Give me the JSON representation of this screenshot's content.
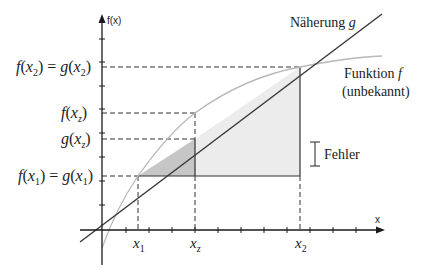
{
  "diagram": {
    "y_axis_label": "f(x)",
    "x_axis_label": "x",
    "line_label": {
      "text": "Näherung ",
      "var": "g"
    },
    "curve_label": {
      "text": "Funktion ",
      "var": "f",
      "subtitle": "(unbekannt)"
    },
    "error_label": "Fehler",
    "y_labels": [
      {
        "id": "f_x2_eq_g_x2",
        "lhs": "f",
        "lhs_arg": "x",
        "lhs_sub": "2",
        "rhs": "g",
        "rhs_arg": "x",
        "rhs_sub": "2"
      },
      {
        "id": "f_xz",
        "lhs": "f",
        "lhs_arg": "x",
        "lhs_sub": "z"
      },
      {
        "id": "g_xz",
        "lhs": "g",
        "lhs_arg": "x",
        "lhs_sub": "z"
      },
      {
        "id": "f_x1_eq_g_x1",
        "lhs": "f",
        "lhs_arg": "x",
        "lhs_sub": "1",
        "rhs": "g",
        "rhs_arg": "x",
        "rhs_sub": "1"
      }
    ],
    "x_labels": [
      {
        "id": "x1",
        "var": "x",
        "sub": "1"
      },
      {
        "id": "xz",
        "var": "x",
        "sub": "z"
      },
      {
        "id": "x2",
        "var": "x",
        "sub": "2"
      }
    ],
    "colors": {
      "axis": "#1a1a1a",
      "line_g": "#3a3a3a",
      "curve_f": "#b8b8b8",
      "triangle_dark": "#c4c4c4",
      "triangle_light": "#ececec",
      "dashed": "#333333"
    }
  }
}
